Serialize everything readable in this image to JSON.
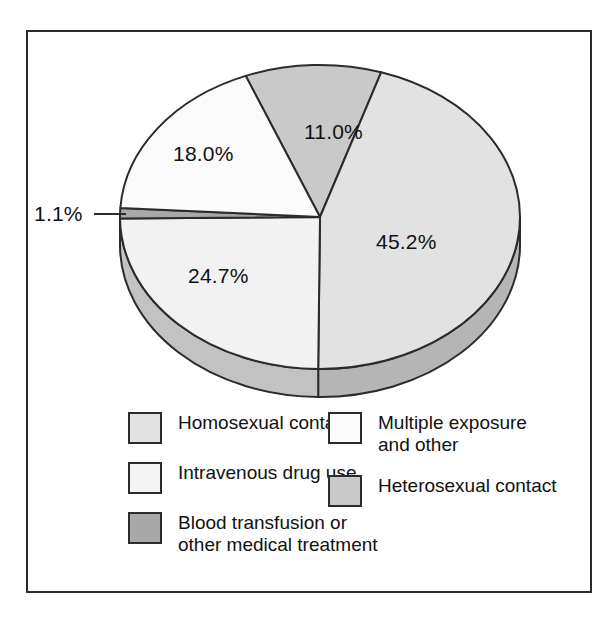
{
  "figure": {
    "border_color": "#2b2b2b",
    "background": "#ffffff"
  },
  "chart_data": {
    "type": "pie",
    "title": "",
    "subtitle": "",
    "xlabel": "",
    "ylabel": "",
    "legend_position": "bottom",
    "grid": false,
    "three_d": true,
    "categories": [
      "Heterosexual contact",
      "Homosexual contact",
      "Intravenous drug use",
      "Blood transfusion or other medical treatment",
      "Multiple exposure and other"
    ],
    "values": [
      11.0,
      45.2,
      24.7,
      1.1,
      18.0
    ],
    "labels": [
      "11.0%",
      "45.2%",
      "24.7%",
      "1.1%",
      "18.0%"
    ],
    "colors": [
      "#c9c9c9",
      "#e2e2e2",
      "#f2f2f2",
      "#a8a8a8",
      "#fbfbfb"
    ],
    "units": "percent",
    "slices": [
      {
        "name": "Heterosexual contact",
        "value": 11.0,
        "label": "11.0%",
        "color": "#c9c9c9",
        "label_x": 318,
        "label_y": 105
      },
      {
        "name": "Homosexual contact",
        "value": 45.2,
        "label": "45.2%",
        "color": "#e2e2e2",
        "label_x": 423,
        "label_y": 246
      },
      {
        "name": "Intravenous drug use",
        "value": 24.7,
        "label": "24.7%",
        "color": "#f2f2f2",
        "label_x": 237,
        "label_y": 283
      },
      {
        "name": "Blood transfusion or other medical treatment",
        "value": 1.1,
        "label": "1.1%",
        "color": "#a8a8a8",
        "label_x": 55,
        "label_y": 212,
        "callout": true
      },
      {
        "name": "Multiple exposure and other",
        "value": 18.0,
        "label": "18.0%",
        "color": "#fbfbfb",
        "label_x": 215,
        "label_y": 155
      }
    ]
  },
  "legend": {
    "left_column": [
      {
        "label": "Homosexual contact",
        "lines": [
          "Homosexual contact"
        ],
        "color": "#e2e2e2"
      },
      {
        "label": "Intravenous drug use",
        "lines": [
          "Intravenous drug use"
        ],
        "color": "#f2f2f2"
      },
      {
        "label": "Blood transfusion or other medical treatment",
        "lines": [
          "Blood transfusion or",
          "other medical treatment"
        ],
        "color": "#a8a8a8"
      }
    ],
    "right_column": [
      {
        "label": "Multiple exposure and other",
        "lines": [
          "Multiple exposure",
          "and other"
        ],
        "color": "#fbfbfb"
      },
      {
        "label": "Heterosexual contact",
        "lines": [
          "Heterosexual contact"
        ],
        "color": "#c9c9c9"
      }
    ]
  }
}
